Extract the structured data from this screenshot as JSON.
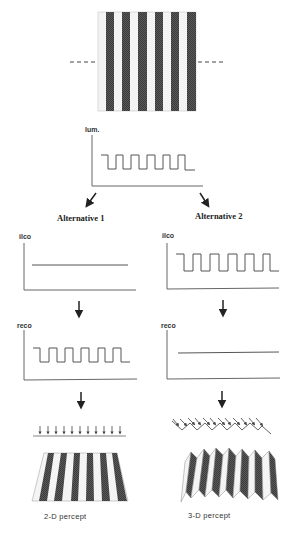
{
  "figure": {
    "stimulus": {
      "description": "square-wave luminance grating",
      "dark_stripes": 6,
      "light_stripes": 6,
      "scanline": "dashed horizontal line across middle"
    },
    "luminance_plot": {
      "ylabel": "lum.",
      "signal": "square-wave",
      "cycles": 5
    },
    "alternatives": [
      {
        "title": "Alternative 1",
        "ilco_plot": {
          "ylabel": "ilco",
          "signal": "flat"
        },
        "reco_plot": {
          "ylabel": "reco",
          "signal": "square-wave",
          "cycles": 5
        },
        "illumination": {
          "type": "uniform parallel arrows",
          "arrow_count": 11
        },
        "percept": {
          "label": "2-D percept",
          "shape": "flat striped plane in perspective"
        }
      },
      {
        "title": "Alternative 2",
        "ilco_plot": {
          "ylabel": "ilco",
          "signal": "square-wave",
          "cycles": 5
        },
        "reco_plot": {
          "ylabel": "reco",
          "signal": "flat"
        },
        "illumination": {
          "type": "arrows onto zigzag (folded) surface profile",
          "arrow_count": 12
        },
        "percept": {
          "label": "3-D percept",
          "shape": "folded corrugated surface"
        }
      }
    ],
    "colors": {
      "dark_stripe": "#4a4a4a",
      "light_stripe": "#f4f4f4",
      "line": "#555555",
      "arrow": "#222222"
    }
  }
}
